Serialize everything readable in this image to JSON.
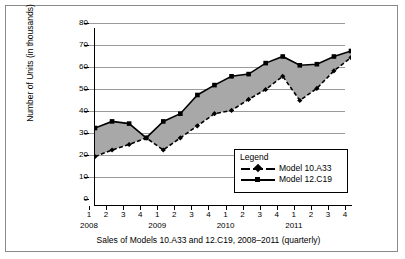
{
  "chart_data": {
    "type": "line",
    "title": "",
    "caption": "Sales of Models 10.A33 and 12.C19, 2008–2011 (quarterly)",
    "xlabel": "",
    "ylabel": "Number of Units (in thousands)",
    "ylim": [
      0,
      80
    ],
    "ytick_values": [
      0,
      10,
      20,
      30,
      40,
      50,
      60,
      70,
      80
    ],
    "ytick_labels": [
      "0",
      "10",
      "20",
      "30",
      "40",
      "50",
      "60",
      "70",
      "80"
    ],
    "grid": true,
    "legend_position": "inside lower-right",
    "legend_title": "Legend",
    "quarter_labels": [
      "1",
      "2",
      "3",
      "4",
      "1",
      "2",
      "3",
      "4",
      "1",
      "2",
      "3",
      "4",
      "1",
      "2",
      "3",
      "4"
    ],
    "year_groups": [
      "2008",
      "2009",
      "2010",
      "2011"
    ],
    "categories": [
      "2008 Q1",
      "2008 Q2",
      "2008 Q3",
      "2008 Q4",
      "2009 Q1",
      "2009 Q2",
      "2009 Q3",
      "2009 Q4",
      "2010 Q1",
      "2010 Q2",
      "2010 Q3",
      "2010 Q4",
      "2011 Q1",
      "2011 Q2",
      "2011 Q3",
      "2011 Q4"
    ],
    "series": [
      {
        "name": "Model 10.A33",
        "style": "dashed",
        "marker": "diamond",
        "color": "#000000",
        "values": [
          22,
          25,
          27.5,
          30.5,
          25,
          30.5,
          36,
          41.5,
          43,
          48,
          52.5,
          58.5,
          47.5,
          53,
          61,
          67
        ]
      },
      {
        "name": "Model 12.C19",
        "style": "solid",
        "marker": "square",
        "color": "#000000",
        "values": [
          35,
          38,
          37,
          30.5,
          38,
          41.5,
          50,
          54.5,
          58.5,
          59.5,
          64.5,
          67.5,
          63.5,
          64,
          67.5,
          70
        ]
      }
    ],
    "fill_between": true,
    "fill_color": "#a8a8a8"
  },
  "figure": {
    "border_color": "#8a8a8a",
    "background": "#ffffff"
  }
}
